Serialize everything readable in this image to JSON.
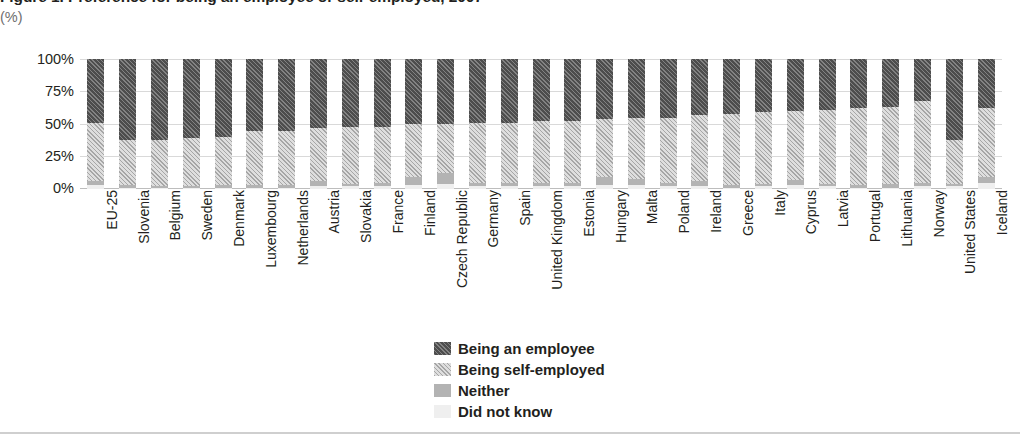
{
  "chart_title": "Figure 1. Preference for being an employee or self-employed, 2007",
  "axis_unit": "(%)",
  "y_ticks": [
    "100%",
    "75%",
    "50%",
    "25%",
    "0%"
  ],
  "legend": [
    {
      "label": "Being an employee",
      "key": "employee",
      "color": "#4d4d4d",
      "pattern": "dark-hatch"
    },
    {
      "label": "Being self-employed",
      "key": "self_employed",
      "color": "#dedede",
      "pattern": "light-hatch"
    },
    {
      "label": "Neither",
      "key": "neither",
      "color": "#b3b3b3",
      "pattern": "solid"
    },
    {
      "label": "Did not know",
      "key": "did_not_know",
      "color": "#efefef",
      "pattern": "solid"
    }
  ],
  "chart_data": {
    "type": "bar",
    "subtype": "stacked-100-percent",
    "title": "Figure 1. Preference for being an employee or self-employed, 2007",
    "xlabel": "",
    "ylabel": "(%)",
    "ylim": [
      0,
      100
    ],
    "ytick_values": [
      0,
      25,
      50,
      75,
      100
    ],
    "grid": true,
    "legend_position": "bottom-center",
    "orientation": "vertical",
    "categories": [
      "EU-25",
      "Slovenia",
      "Belgium",
      "Sweden",
      "Denmark",
      "Luxembourg",
      "Netherlands",
      "Austria",
      "Slovakia",
      "France",
      "Finland",
      "Czech Republic",
      "Germany",
      "Spain",
      "United Kingdom",
      "Estonia",
      "Hungary",
      "Malta",
      "Poland",
      "Ireland",
      "Greece",
      "Italy",
      "Cyprus",
      "Latvia",
      "Portugal",
      "Lithuania",
      "Norway",
      "United States",
      "Iceland"
    ],
    "series": [
      {
        "name": "Being an employee",
        "values": [
          49,
          62,
          62,
          61,
          60,
          55,
          55,
          53,
          52,
          52,
          50,
          50,
          49,
          49,
          48,
          48,
          46,
          45,
          45,
          43,
          42,
          41,
          40,
          39,
          38,
          37,
          32,
          62,
          38
        ]
      },
      {
        "name": "Being self-employed",
        "values": [
          45,
          35,
          36,
          37,
          37,
          42,
          42,
          41,
          44,
          43,
          41,
          38,
          46,
          46,
          47,
          47,
          45,
          47,
          50,
          51,
          55,
          55,
          53,
          57,
          59,
          59,
          63,
          34,
          53
        ]
      },
      {
        "name": "Neither",
        "values": [
          3,
          2,
          1,
          1,
          2,
          2,
          2,
          4,
          2,
          3,
          6,
          8,
          3,
          3,
          3,
          3,
          6,
          5,
          3,
          4,
          2,
          2,
          4,
          2,
          2,
          3,
          3,
          2,
          4
        ]
      },
      {
        "name": "Did not know",
        "values": [
          3,
          1,
          1,
          1,
          1,
          1,
          1,
          2,
          2,
          2,
          3,
          4,
          2,
          2,
          2,
          2,
          3,
          3,
          2,
          2,
          1,
          2,
          3,
          2,
          1,
          1,
          2,
          2,
          5
        ]
      }
    ]
  }
}
